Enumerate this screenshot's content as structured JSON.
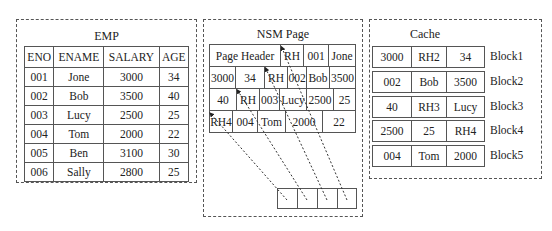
{
  "emp": {
    "title": "EMP",
    "headers": [
      "ENO",
      "ENAME",
      "SALARY",
      "AGE"
    ],
    "rows": [
      [
        "001",
        "Jone",
        "3000",
        "34"
      ],
      [
        "002",
        "Bob",
        "3500",
        "40"
      ],
      [
        "003",
        "Lucy",
        "2500",
        "25"
      ],
      [
        "004",
        "Tom",
        "2000",
        "22"
      ],
      [
        "005",
        "Ben",
        "3100",
        "30"
      ],
      [
        "006",
        "Sally",
        "2800",
        "25"
      ]
    ]
  },
  "nsm": {
    "title": "NSM Page",
    "row1": [
      "Page Header",
      "RH",
      "001",
      "Jone"
    ],
    "row2": [
      "3000",
      "34",
      "RH",
      "002",
      "Bob",
      "3500"
    ],
    "row3": [
      "40",
      "RH",
      "003",
      "Lucy",
      "2500",
      "25"
    ],
    "row4": [
      "RH4",
      "004",
      "Tom",
      "2000",
      "22"
    ]
  },
  "cache": {
    "title": "Cache",
    "blocks": [
      {
        "cells": [
          "3000",
          "RH2",
          "34"
        ],
        "label": "Block1"
      },
      {
        "cells": [
          "002",
          "Bob",
          "3500"
        ],
        "label": "Block2"
      },
      {
        "cells": [
          "40",
          "RH3",
          "Lucy"
        ],
        "label": "Block3"
      },
      {
        "cells": [
          "2500",
          "25",
          "RH4"
        ],
        "label": "Block4"
      },
      {
        "cells": [
          "004",
          "Tom",
          "2000"
        ],
        "label": "Block5"
      }
    ]
  }
}
